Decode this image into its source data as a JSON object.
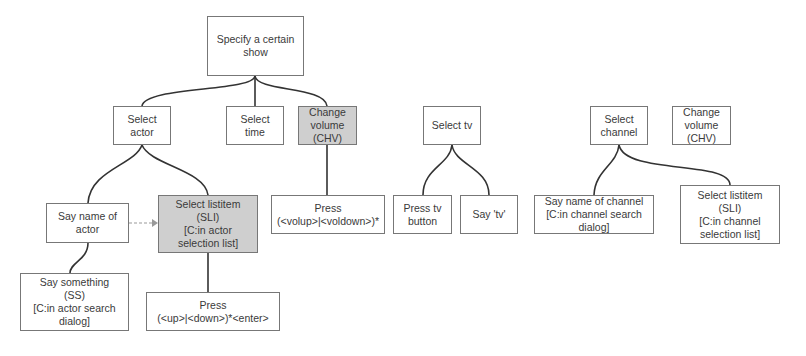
{
  "nodes": {
    "specify_show": "Specify a certain\nshow",
    "select_actor": "Select\nactor",
    "select_time": "Select\ntime",
    "change_volume_1": "Change\nvolume\n(CHV)",
    "say_name_actor": "Say name of\nactor",
    "select_listitem_actor": "Select listitem\n(SLI)\n[C:in actor\nselection list]",
    "say_something": "Say something\n(SS)\n[C:in actor search\ndialog]",
    "press_up_down": "Press\n(<up>|<down>)*<enter>",
    "press_vol": "Press\n(<volup>|<voldown>)*",
    "select_tv": "Select tv",
    "press_tv_button": "Press tv\nbutton",
    "say_tv": "Say 'tv'",
    "select_channel": "Select\nchannel",
    "change_volume_2": "Change\nvolume\n(CHV)",
    "say_name_channel": "Say name of channel\n[C:in channel search\ndialog]",
    "select_listitem_channel": "Select listitem\n(SLI)\n[C:in channel\nselection list]"
  },
  "colors": {
    "shaded": "#cfcfcf",
    "border": "#777777",
    "line": "#333333"
  }
}
